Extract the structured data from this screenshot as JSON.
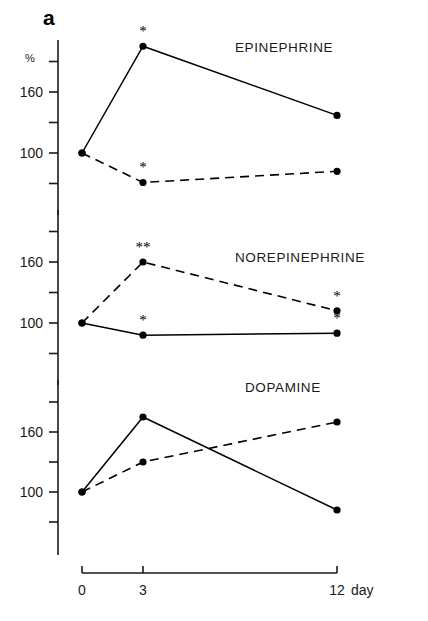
{
  "figure": {
    "panel_letter": "a",
    "y_axis_unit": "%",
    "x_axis_unit": "day"
  },
  "chart_data": {
    "type": "line",
    "title": "",
    "xlabel": "day",
    "ylabel": "%",
    "x": [
      0,
      3,
      12
    ],
    "xtick_labels": [
      "0",
      "3",
      "12"
    ],
    "xlim": [
      0,
      13.2
    ],
    "grid": false,
    "legend_position": "none",
    "panels": [
      {
        "title": "EPINEPHRINE",
        "ylim": [
          40,
          220
        ],
        "ytick_values": [
          70,
          100,
          130,
          160,
          190
        ],
        "ytick_labels": [
          "",
          "100",
          "",
          "160",
          ""
        ],
        "series": [
          {
            "name": "solid",
            "style": "solid",
            "values": [
              100,
              205,
              137
            ],
            "significance": [
              "",
              "*",
              ""
            ]
          },
          {
            "name": "dashed",
            "style": "dashed",
            "values": [
              100,
              71,
              82
            ],
            "significance": [
              "",
              "*",
              ""
            ]
          }
        ]
      },
      {
        "title": "NOREPINEPHRINE",
        "ylim": [
          40,
          220
        ],
        "ytick_values": [
          70,
          100,
          130,
          160,
          190
        ],
        "ytick_labels": [
          "",
          "100",
          "",
          "160",
          ""
        ],
        "series": [
          {
            "name": "dashed",
            "style": "dashed",
            "values": [
              100,
              160,
              112
            ],
            "significance": [
              "",
              "**",
              "*"
            ]
          },
          {
            "name": "solid",
            "style": "solid",
            "values": [
              100,
              88,
              90
            ],
            "significance": [
              "",
              "*",
              "*"
            ]
          }
        ]
      },
      {
        "title": "DOPAMINE",
        "ylim": [
          40,
          220
        ],
        "ytick_values": [
          70,
          100,
          130,
          160,
          190
        ],
        "ytick_labels": [
          "",
          "100",
          "",
          "160",
          ""
        ],
        "series": [
          {
            "name": "solid",
            "style": "solid",
            "values": [
              100,
              175,
              82
            ],
            "significance": [
              "",
              "",
              ""
            ]
          },
          {
            "name": "dashed",
            "style": "dashed",
            "values": [
              100,
              130,
              170
            ],
            "significance": [
              "",
              "",
              ""
            ]
          }
        ]
      }
    ]
  }
}
